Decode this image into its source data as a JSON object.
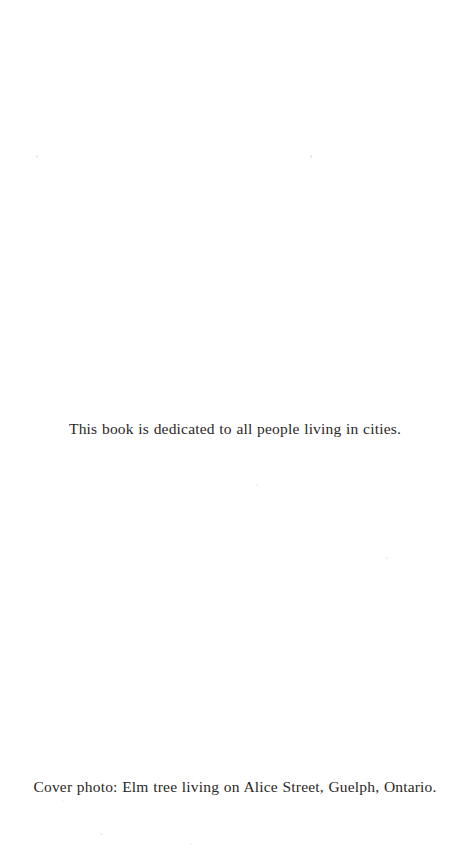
{
  "page": {
    "kind": "book-dedication-page",
    "background_color": "#ffffff",
    "text_color": "#2a2725",
    "width": 470,
    "height": 865
  },
  "dedication": {
    "text": "This book is dedicated to all people living in cities."
  },
  "cover_credit": {
    "text": "Cover photo: Elm tree living on Alice Street, Guelph, Ontario."
  }
}
